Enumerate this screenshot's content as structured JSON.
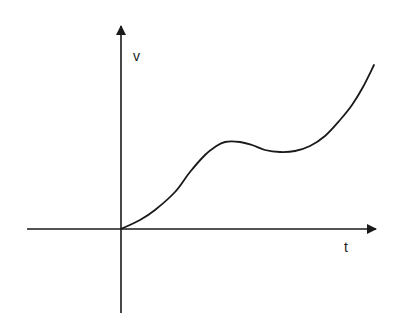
{
  "diagram": {
    "type": "velocity-time graph",
    "axes": {
      "y_label": "v",
      "x_label": "t",
      "origin": [
        121,
        229
      ]
    },
    "curve": {
      "description": "Velocity rises from origin, levels into a local maximum, dips slightly to a local minimum, then rises steeply",
      "points": [
        [
          121,
          229
        ],
        [
          140,
          220
        ],
        [
          155,
          210
        ],
        [
          175,
          192
        ],
        [
          190,
          172
        ],
        [
          205,
          155
        ],
        [
          215,
          147
        ],
        [
          225,
          142
        ],
        [
          240,
          142
        ],
        [
          252,
          145
        ],
        [
          265,
          150
        ],
        [
          280,
          152
        ],
        [
          295,
          151
        ],
        [
          310,
          146
        ],
        [
          325,
          136
        ],
        [
          340,
          120
        ],
        [
          352,
          105
        ],
        [
          363,
          87
        ],
        [
          374,
          65
        ]
      ]
    },
    "colors": {
      "stroke": "#1a1a1a",
      "background": "#ffffff"
    }
  }
}
